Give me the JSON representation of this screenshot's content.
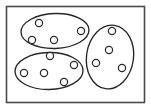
{
  "figure": {
    "width": 151,
    "height": 109,
    "background_color": "#ffffff"
  },
  "colors": {
    "frame_stroke": "#4a4a4a",
    "ellipse_stroke": "#262626",
    "point_stroke": "#2b2b2b",
    "point_fill": "#ffffff",
    "canvas_fill": "#ffffff"
  },
  "frame": {
    "name": "outer-frame",
    "x": 6.5,
    "y": 6.5,
    "width": 138,
    "height": 96,
    "stroke_width": 1.6
  },
  "chart_data": {
    "type": "scatter",
    "xlabel": "",
    "ylabel": "",
    "xlim": [
      0,
      151
    ],
    "ylim": [
      0,
      109
    ],
    "grid": false,
    "legend": "none",
    "cluster_count": 3,
    "point_count": 13,
    "point_radius": 3.6,
    "clusters": [
      {
        "name": "cluster-top-left",
        "label": "Cluster 1",
        "shape": "ellipse",
        "cx": 55,
        "cy": 31,
        "rx": 34,
        "ry": 17.5,
        "rotation": -2,
        "point_count": 4,
        "points": [
          {
            "x": 39,
            "y": 23
          },
          {
            "x": 32,
            "y": 40
          },
          {
            "x": 54,
            "y": 40
          },
          {
            "x": 81,
            "y": 31
          }
        ]
      },
      {
        "name": "cluster-bottom-left",
        "label": "Cluster 2",
        "shape": "ellipse",
        "cx": 49,
        "cy": 71,
        "rx": 34,
        "ry": 18.5,
        "rotation": -1,
        "point_count": 5,
        "points": [
          {
            "x": 50,
            "y": 56
          },
          {
            "x": 24,
            "y": 73
          },
          {
            "x": 44,
            "y": 73
          },
          {
            "x": 74,
            "y": 65
          },
          {
            "x": 64,
            "y": 82
          }
        ]
      },
      {
        "name": "cluster-right",
        "label": "Cluster 3",
        "shape": "ellipse",
        "cx": 110,
        "cy": 57,
        "rx": 23.5,
        "ry": 32,
        "rotation": 8,
        "point_count": 4,
        "points": [
          {
            "x": 112,
            "y": 31
          },
          {
            "x": 109,
            "y": 50
          },
          {
            "x": 96,
            "y": 63
          },
          {
            "x": 122,
            "y": 68
          }
        ]
      }
    ]
  }
}
